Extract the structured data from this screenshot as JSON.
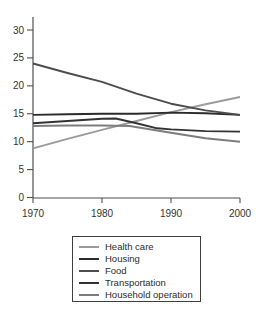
{
  "chart_data": {
    "type": "line",
    "title": "",
    "xlabel": "",
    "ylabel": "",
    "xlim": [
      1970,
      2000
    ],
    "ylim": [
      0,
      30
    ],
    "grid": false,
    "legend_position": "bottom",
    "x_ticks": [
      "1970",
      "1980",
      "1990",
      "2000"
    ],
    "x_tick_values": [
      1970,
      1980,
      1990,
      2000
    ],
    "y_ticks": [
      "0",
      "5",
      "10",
      "15",
      "20",
      "25",
      "30"
    ],
    "y_tick_values": [
      0,
      5,
      10,
      15,
      20,
      25,
      30
    ],
    "series": [
      {
        "name": "Health care",
        "color": "#9b9b9b",
        "points": [
          [
            1970,
            8.8
          ],
          [
            1975,
            10.5
          ],
          [
            1980,
            12.1
          ],
          [
            1985,
            13.7
          ],
          [
            1990,
            15.3
          ],
          [
            1995,
            16.7
          ],
          [
            2000,
            18.0
          ]
        ]
      },
      {
        "name": "Housing",
        "color": "#2b2b2b",
        "points": [
          [
            1970,
            14.8
          ],
          [
            1975,
            14.9
          ],
          [
            1980,
            15.0
          ],
          [
            1985,
            15.0
          ],
          [
            1990,
            15.2
          ],
          [
            1995,
            15.1
          ],
          [
            2000,
            14.8
          ]
        ]
      },
      {
        "name": "Food",
        "color": "#4d4d4d",
        "points": [
          [
            1970,
            24.0
          ],
          [
            1975,
            22.3
          ],
          [
            1980,
            20.7
          ],
          [
            1985,
            18.6
          ],
          [
            1990,
            16.8
          ],
          [
            1995,
            15.6
          ],
          [
            2000,
            14.8
          ]
        ]
      },
      {
        "name": "Transportation",
        "color": "#333333",
        "points": [
          [
            1970,
            13.3
          ],
          [
            1975,
            13.7
          ],
          [
            1980,
            14.1
          ],
          [
            1982,
            14.15
          ],
          [
            1985,
            13.3
          ],
          [
            1988,
            12.4
          ],
          [
            1990,
            12.2
          ],
          [
            1995,
            11.9
          ],
          [
            2000,
            11.8
          ]
        ]
      },
      {
        "name": "Household operation",
        "color": "#7d7d7d",
        "points": [
          [
            1970,
            12.8
          ],
          [
            1975,
            12.9
          ],
          [
            1980,
            12.9
          ],
          [
            1984,
            12.8
          ],
          [
            1990,
            11.6
          ],
          [
            1995,
            10.6
          ],
          [
            2000,
            10.0
          ]
        ]
      }
    ],
    "axis_color": "#4f4f4f",
    "tick_label_color": "#333333"
  }
}
